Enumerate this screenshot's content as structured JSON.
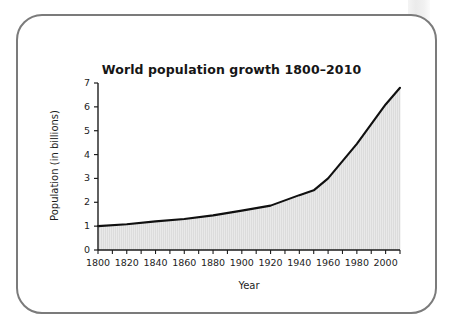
{
  "figure": {
    "title": "World population growth 1800–2010",
    "x_axis_title": "Year",
    "y_axis_title": "Population (in billions)"
  },
  "colors": {
    "frame_border": "#7b7b7b",
    "area_fill": "#dcdcdc",
    "line": "#101010",
    "axis": "#1d1d1d",
    "background": "#ffffff"
  },
  "chart_data": {
    "type": "area",
    "title": "World population growth 1800–2010",
    "xlabel": "Year",
    "ylabel": "Population (in billions)",
    "xlim": [
      1800,
      2010
    ],
    "ylim": [
      0,
      7
    ],
    "grid": false,
    "legend": "none",
    "x_ticks": [
      1800,
      1820,
      1840,
      1860,
      1880,
      1900,
      1920,
      1940,
      1960,
      1980,
      2000
    ],
    "x_tick_labels": [
      "1800",
      "1820",
      "1840",
      "1860",
      "1880",
      "1900",
      "1920",
      "1940",
      "1960",
      "1980",
      "2000"
    ],
    "x_minor_tick_step": 10,
    "y_ticks": [
      0,
      1,
      2,
      3,
      4,
      5,
      6,
      7
    ],
    "y_tick_labels": [
      "0",
      "1",
      "2",
      "3",
      "4",
      "5",
      "6",
      "7"
    ],
    "series": [
      {
        "name": "World population (billions)",
        "x": [
          1800,
          1820,
          1840,
          1860,
          1880,
          1900,
          1920,
          1940,
          1950,
          1960,
          1980,
          2000,
          2010
        ],
        "values": [
          1.0,
          1.08,
          1.2,
          1.3,
          1.45,
          1.65,
          1.86,
          2.3,
          2.5,
          3.0,
          4.45,
          6.1,
          6.8
        ]
      }
    ]
  }
}
